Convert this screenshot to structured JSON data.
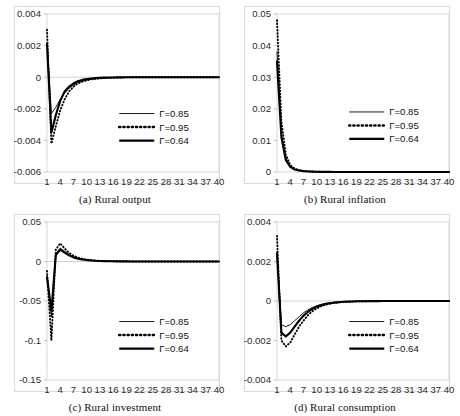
{
  "figure": {
    "background": "#ffffff",
    "panel_count": 4
  },
  "legend": {
    "entries": [
      {
        "label": "Γ=0.85",
        "style": "thin-solid"
      },
      {
        "label": "Γ=0.95",
        "style": "dotted"
      },
      {
        "label": "Γ=0.64",
        "style": "thick-solid"
      }
    ]
  },
  "panels": [
    {
      "id": "a",
      "caption": "(a) Rural output",
      "ylabels": [
        "0.004",
        "0.002",
        "0",
        "-0.002",
        "-0.004",
        "-0.006"
      ],
      "xlabels": [
        "1",
        "4",
        "7",
        "10",
        "13",
        "16",
        "19",
        "22",
        "25",
        "28",
        "31",
        "34",
        "37",
        "40"
      ]
    },
    {
      "id": "b",
      "caption": "(b) Rural inflation",
      "ylabels": [
        "0.05",
        "0.04",
        "0.03",
        "0.02",
        "0.01",
        "0"
      ],
      "xlabels": [
        "1",
        "4",
        "7",
        "10",
        "13",
        "16",
        "19",
        "22",
        "25",
        "28",
        "31",
        "34",
        "37",
        "40"
      ]
    },
    {
      "id": "c",
      "caption": "(c) Rural investment",
      "ylabels": [
        "0.05",
        "0",
        "-0.05",
        "-0.1",
        "-0.15"
      ],
      "xlabels": [
        "1",
        "4",
        "7",
        "10",
        "13",
        "16",
        "19",
        "22",
        "25",
        "28",
        "31",
        "34",
        "37",
        "40"
      ]
    },
    {
      "id": "d",
      "caption": "(d) Rural consumption",
      "ylabels": [
        "0.004",
        "0.002",
        "0",
        "-0.002",
        "-0.004"
      ],
      "xlabels": [
        "1",
        "4",
        "7",
        "10",
        "13",
        "16",
        "19",
        "22",
        "25",
        "28",
        "31",
        "34",
        "37",
        "40"
      ]
    }
  ],
  "chart_data": [
    {
      "type": "line",
      "title": "(a) Rural output",
      "xlabel": "",
      "ylabel": "",
      "grid": false,
      "legend_position": "center-right",
      "xlim": [
        1,
        40
      ],
      "ylim": [
        -0.006,
        0.004
      ],
      "yticks": [
        0.004,
        0.002,
        0,
        -0.002,
        -0.004,
        -0.006
      ],
      "xticks": [
        1,
        4,
        7,
        10,
        13,
        16,
        19,
        22,
        25,
        28,
        31,
        34,
        37,
        40
      ],
      "x": [
        1,
        2,
        3,
        4,
        5,
        6,
        7,
        8,
        9,
        10,
        11,
        12,
        13,
        14,
        15,
        16,
        17,
        18,
        19,
        20,
        21,
        22,
        23,
        24,
        25,
        26,
        27,
        28,
        29,
        30,
        31,
        32,
        33,
        34,
        35,
        36,
        37,
        38,
        39,
        40
      ],
      "series": [
        {
          "name": "Γ=0.85",
          "style": "thin-solid",
          "values": [
            0.0022,
            -0.0023,
            -0.0019,
            -0.0014,
            -0.001,
            -0.0007,
            -0.0005,
            -0.00035,
            -0.00025,
            -0.00018,
            -0.00013,
            -9e-05,
            -7e-05,
            -5e-05,
            -4e-05,
            -3e-05,
            -2e-05,
            -1.5e-05,
            -1e-05,
            -8e-06,
            -6e-06,
            -4e-06,
            -3e-06,
            -2e-06,
            -1.5e-06,
            -1e-06,
            -8e-07,
            -6e-07,
            -4e-07,
            -3e-07,
            -2e-07,
            -2e-07,
            -1e-07,
            -1e-07,
            0,
            0,
            0,
            0,
            0,
            0
          ]
        },
        {
          "name": "Γ=0.95",
          "style": "dotted",
          "values": [
            0.003,
            -0.0042,
            -0.0031,
            -0.0021,
            -0.0014,
            -0.0009,
            -0.0006,
            -0.0004,
            -0.00028,
            -0.0002,
            -0.00014,
            -0.0001,
            -7e-05,
            -5e-05,
            -4e-05,
            -3e-05,
            -2e-05,
            -1.5e-05,
            -1e-05,
            -8e-06,
            -6e-06,
            -4e-06,
            -3e-06,
            -2e-06,
            -1.5e-06,
            -1e-06,
            -8e-07,
            -6e-07,
            -4e-07,
            -3e-07,
            -2e-07,
            -2e-07,
            -1e-07,
            -1e-07,
            0,
            0,
            0,
            0,
            0,
            0
          ]
        },
        {
          "name": "Γ=0.64",
          "style": "thick-solid",
          "values": [
            0.0021,
            -0.0035,
            -0.0024,
            -0.0015,
            -0.0009,
            -0.0006,
            -0.0004,
            -0.00025,
            -0.00017,
            -0.00012,
            -8e-05,
            -6e-05,
            -4e-05,
            -3e-05,
            -2e-05,
            -1.5e-05,
            -1e-05,
            -8e-06,
            -6e-06,
            -5e-06,
            -4e-06,
            -3e-06,
            -2e-06,
            -1.5e-06,
            -1e-06,
            -8e-07,
            -6e-07,
            -5e-07,
            -4e-07,
            -3e-07,
            -2e-07,
            -1e-07,
            -1e-07,
            0,
            0,
            0,
            0,
            0,
            0,
            0
          ]
        }
      ]
    },
    {
      "type": "line",
      "title": "(b) Rural inflation",
      "xlabel": "",
      "ylabel": "",
      "grid": false,
      "legend_position": "center-right",
      "xlim": [
        1,
        40
      ],
      "ylim": [
        0,
        0.05
      ],
      "yticks": [
        0.05,
        0.04,
        0.03,
        0.02,
        0.01,
        0
      ],
      "xticks": [
        1,
        4,
        7,
        10,
        13,
        16,
        19,
        22,
        25,
        28,
        31,
        34,
        37,
        40
      ],
      "x": [
        1,
        2,
        3,
        4,
        5,
        6,
        7,
        8,
        9,
        10,
        11,
        12,
        13,
        14,
        15,
        16,
        17,
        18,
        19,
        20,
        21,
        22,
        23,
        24,
        25,
        26,
        27,
        28,
        29,
        30,
        31,
        32,
        33,
        34,
        35,
        36,
        37,
        38,
        39,
        40
      ],
      "series": [
        {
          "name": "Γ=0.85",
          "style": "thin-solid",
          "values": [
            0.038,
            0.012,
            0.0042,
            0.0018,
            0.0009,
            0.0005,
            0.0003,
            0.0002,
            0.00012,
            8e-05,
            5e-05,
            4e-05,
            3e-05,
            2e-05,
            1.5e-05,
            1e-05,
            8e-06,
            6e-06,
            5e-06,
            4e-06,
            3e-06,
            2e-06,
            1.5e-06,
            1e-06,
            8e-07,
            6e-07,
            5e-07,
            4e-07,
            3e-07,
            2e-07,
            2e-07,
            1e-07,
            1e-07,
            0,
            0,
            0,
            0,
            0,
            0,
            0
          ]
        },
        {
          "name": "Γ=0.95",
          "style": "dotted",
          "values": [
            0.048,
            0.016,
            0.0055,
            0.0022,
            0.0011,
            0.0006,
            0.00035,
            0.00022,
            0.00014,
            9e-05,
            6e-05,
            4e-05,
            3e-05,
            2e-05,
            1.6e-05,
            1.2e-05,
            9e-06,
            7e-06,
            5e-06,
            4e-06,
            3e-06,
            2.5e-06,
            2e-06,
            1.5e-06,
            1e-06,
            8e-07,
            6e-07,
            5e-07,
            4e-07,
            3e-07,
            2e-07,
            2e-07,
            1e-07,
            0,
            0,
            0,
            0,
            0,
            0,
            0
          ]
        },
        {
          "name": "Γ=0.64",
          "style": "thick-solid",
          "values": [
            0.035,
            0.011,
            0.0038,
            0.0016,
            0.0008,
            0.00045,
            0.00027,
            0.00017,
            0.00011,
            7e-05,
            5e-05,
            3e-05,
            2.5e-05,
            2e-05,
            1.4e-05,
            1e-05,
            8e-06,
            6e-06,
            4e-06,
            3e-06,
            2.5e-06,
            2e-06,
            1.5e-06,
            1e-06,
            8e-07,
            6e-07,
            5e-07,
            4e-07,
            3e-07,
            2e-07,
            2e-07,
            1e-07,
            1e-07,
            0,
            0,
            0,
            0,
            0,
            0,
            0
          ]
        }
      ]
    },
    {
      "type": "line",
      "title": "(c) Rural investment",
      "xlabel": "",
      "ylabel": "",
      "grid": false,
      "legend_position": "center-right",
      "xlim": [
        1,
        40
      ],
      "ylim": [
        -0.15,
        0.05
      ],
      "yticks": [
        0.05,
        0,
        -0.05,
        -0.1,
        -0.15
      ],
      "xticks": [
        1,
        4,
        7,
        10,
        13,
        16,
        19,
        22,
        25,
        28,
        31,
        34,
        37,
        40
      ],
      "x": [
        1,
        2,
        3,
        4,
        5,
        6,
        7,
        8,
        9,
        10,
        11,
        12,
        13,
        14,
        15,
        16,
        17,
        18,
        19,
        20,
        21,
        22,
        23,
        24,
        25,
        26,
        27,
        28,
        29,
        30,
        31,
        32,
        33,
        34,
        35,
        36,
        37,
        38,
        39,
        40
      ],
      "series": [
        {
          "name": "Γ=0.85",
          "style": "thin-solid",
          "values": [
            -0.018,
            -0.07,
            0.01,
            0.017,
            0.013,
            0.009,
            0.006,
            0.0042,
            0.003,
            0.0021,
            0.0015,
            0.0011,
            0.0008,
            0.0006,
            0.0004,
            0.0003,
            0.00022,
            0.00016,
            0.00012,
            9e-05,
            6e-05,
            5e-05,
            4e-05,
            3e-05,
            2e-05,
            1.5e-05,
            1e-05,
            8e-06,
            6e-06,
            5e-06,
            4e-06,
            3e-06,
            2e-06,
            1.5e-06,
            1e-06,
            8e-07,
            5e-07,
            3e-07,
            2e-07,
            0
          ]
        },
        {
          "name": "Γ=0.95",
          "style": "dotted",
          "values": [
            -0.012,
            -0.1,
            0.015,
            0.023,
            0.0165,
            0.011,
            0.0074,
            0.005,
            0.0035,
            0.0024,
            0.0017,
            0.0012,
            0.0009,
            0.0006,
            0.0005,
            0.00035,
            0.00025,
            0.00018,
            0.00013,
            0.0001,
            7e-05,
            5e-05,
            4e-05,
            3e-05,
            2e-05,
            1.6e-05,
            1.2e-05,
            9e-06,
            7e-06,
            5e-06,
            4e-06,
            3e-06,
            2e-06,
            1.5e-06,
            1e-06,
            8e-07,
            5e-07,
            3e-07,
            2e-07,
            0
          ]
        },
        {
          "name": "Γ=0.64",
          "style": "thick-solid",
          "values": [
            -0.02,
            -0.062,
            0.008,
            0.015,
            0.0112,
            0.0078,
            0.0052,
            0.0036,
            0.0025,
            0.0018,
            0.0013,
            0.0009,
            0.0007,
            0.0005,
            0.00035,
            0.00026,
            0.00019,
            0.00014,
            0.0001,
            8e-05,
            6e-05,
            4e-05,
            3e-05,
            2.5e-05,
            2e-05,
            1.4e-05,
            1e-05,
            8e-06,
            6e-06,
            4e-06,
            3e-06,
            2.5e-06,
            2e-06,
            1.5e-06,
            1e-06,
            7e-07,
            5e-07,
            3e-07,
            2e-07,
            0
          ]
        }
      ]
    },
    {
      "type": "line",
      "title": "(d) Rural consumption",
      "xlabel": "",
      "ylabel": "",
      "grid": false,
      "legend_position": "center-right",
      "xlim": [
        1,
        40
      ],
      "ylim": [
        -0.004,
        0.004
      ],
      "yticks": [
        0.004,
        0.002,
        0,
        -0.002,
        -0.004
      ],
      "xticks": [
        1,
        4,
        7,
        10,
        13,
        16,
        19,
        22,
        25,
        28,
        31,
        34,
        37,
        40
      ],
      "x": [
        1,
        2,
        3,
        4,
        5,
        6,
        7,
        8,
        9,
        10,
        11,
        12,
        13,
        14,
        15,
        16,
        17,
        18,
        19,
        20,
        21,
        22,
        23,
        24,
        25,
        26,
        27,
        28,
        29,
        30,
        31,
        32,
        33,
        34,
        35,
        36,
        37,
        38,
        39,
        40
      ],
      "series": [
        {
          "name": "Γ=0.85",
          "style": "thin-solid",
          "values": [
            0.0025,
            -0.0012,
            -0.0013,
            -0.0012,
            -0.001,
            -0.0008,
            -0.0006,
            -0.00045,
            -0.00033,
            -0.00024,
            -0.00017,
            -0.00012,
            -9e-05,
            -6e-05,
            -5e-05,
            -3e-05,
            -2.5e-05,
            -2e-05,
            -1.4e-05,
            -1e-05,
            -8e-06,
            -6e-06,
            -4e-06,
            -3e-06,
            -2.5e-06,
            -2e-06,
            -1.5e-06,
            -1e-06,
            -8e-07,
            -6e-07,
            -5e-07,
            -4e-07,
            -3e-07,
            -2e-07,
            -1e-07,
            0,
            0,
            0,
            0,
            0
          ]
        },
        {
          "name": "Γ=0.95",
          "style": "dotted",
          "values": [
            0.0033,
            -0.002,
            -0.0023,
            -0.0021,
            -0.0017,
            -0.0013,
            -0.001,
            -0.00072,
            -0.00052,
            -0.00037,
            -0.00027,
            -0.00019,
            -0.00014,
            -0.0001,
            -7e-05,
            -5e-05,
            -4e-05,
            -3e-05,
            -2e-05,
            -1.5e-05,
            -1e-05,
            -8e-06,
            -6e-06,
            -5e-06,
            -4e-06,
            -3e-06,
            -2e-06,
            -1.5e-06,
            -1e-06,
            -8e-07,
            -6e-07,
            -5e-07,
            -4e-07,
            -3e-07,
            -2e-07,
            0,
            0,
            0,
            0,
            0
          ]
        },
        {
          "name": "Γ=0.64",
          "style": "thick-solid",
          "values": [
            0.0024,
            -0.0016,
            -0.0018,
            -0.0016,
            -0.0013,
            -0.001,
            -0.00075,
            -0.00055,
            -0.0004,
            -0.00029,
            -0.00021,
            -0.00015,
            -0.00011,
            -8e-05,
            -6e-05,
            -4e-05,
            -3e-05,
            -2.2e-05,
            -1.6e-05,
            -1.2e-05,
            -9e-06,
            -7e-06,
            -5e-06,
            -4e-06,
            -3e-06,
            -2.5e-06,
            -2e-06,
            -1.5e-06,
            -1e-06,
            -8e-07,
            -6e-07,
            -5e-07,
            -4e-07,
            -3e-07,
            -2e-07,
            0,
            0,
            0,
            0,
            0
          ]
        }
      ]
    }
  ]
}
